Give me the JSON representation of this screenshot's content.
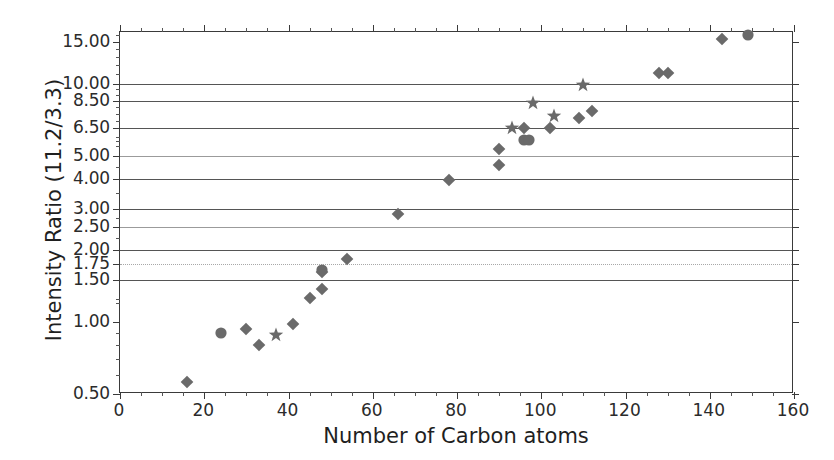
{
  "chart_data": {
    "type": "scatter",
    "title": "",
    "xlabel": "Number of Carbon atoms",
    "ylabel": "Intensity Ratio (11.2/3.3)",
    "xlim": [
      0,
      160
    ],
    "ylim": [
      0.5,
      16.5
    ],
    "yscale": "log",
    "grid": true,
    "legend": null,
    "marker_color": "#6a6a6a",
    "axis_color": "#3a3a3a",
    "gridline_color": "#555555",
    "xticks": [
      0,
      20,
      40,
      60,
      80,
      100,
      120,
      140,
      160
    ],
    "xtick_labels": [
      "0",
      "20",
      "40",
      "60",
      "80",
      "100",
      "120",
      "140",
      "160"
    ],
    "xtick_minor_step": 5,
    "yticks": [
      0.5,
      1.0,
      1.5,
      1.75,
      2.0,
      2.5,
      3.0,
      4.0,
      5.0,
      6.5,
      8.5,
      10.0,
      15.0
    ],
    "ytick_labels": [
      "0.50",
      "1.00",
      "1.50",
      "1.75",
      "2.00",
      "2.50",
      "3.00",
      "4.00",
      "5.00",
      "6.50",
      "8.50",
      "10.00",
      "15.00"
    ],
    "gridline_values": [
      1.5,
      1.75,
      2.0,
      2.5,
      3.0,
      4.0,
      5.0,
      6.5,
      8.5,
      10.0
    ],
    "ytick_minor_values": [
      0.6,
      0.7,
      0.8,
      0.9,
      1.2,
      1.25,
      2.25,
      2.75,
      3.5,
      4.5,
      5.5,
      5.75,
      6.0,
      7.0,
      7.5,
      8.0,
      9.0,
      9.5,
      11.0,
      12.0,
      13.0,
      14.0,
      16.0
    ],
    "series": [
      {
        "name": "diamond-series",
        "marker": "diamond",
        "points": [
          {
            "x": 16,
            "y": 0.56
          },
          {
            "x": 30,
            "y": 0.94
          },
          {
            "x": 33,
            "y": 0.8
          },
          {
            "x": 41,
            "y": 0.98
          },
          {
            "x": 45,
            "y": 1.26
          },
          {
            "x": 48,
            "y": 1.38
          },
          {
            "x": 48,
            "y": 1.63
          },
          {
            "x": 54,
            "y": 1.85
          },
          {
            "x": 66,
            "y": 2.85
          },
          {
            "x": 78,
            "y": 3.95
          },
          {
            "x": 90,
            "y": 5.35
          },
          {
            "x": 90,
            "y": 4.55
          },
          {
            "x": 96,
            "y": 6.55
          },
          {
            "x": 102,
            "y": 6.55
          },
          {
            "x": 109,
            "y": 7.2
          },
          {
            "x": 112,
            "y": 7.7
          },
          {
            "x": 128,
            "y": 11.1
          },
          {
            "x": 130,
            "y": 11.1
          },
          {
            "x": 143,
            "y": 15.4
          }
        ]
      },
      {
        "name": "circle-series",
        "marker": "circle",
        "points": [
          {
            "x": 24,
            "y": 0.9
          },
          {
            "x": 48,
            "y": 1.66
          },
          {
            "x": 96,
            "y": 5.8
          },
          {
            "x": 97,
            "y": 5.8
          },
          {
            "x": 149,
            "y": 16.0
          }
        ]
      },
      {
        "name": "star-series",
        "marker": "star",
        "points": [
          {
            "x": 37,
            "y": 0.88
          },
          {
            "x": 93,
            "y": 6.55
          },
          {
            "x": 98,
            "y": 8.3
          },
          {
            "x": 103,
            "y": 7.3
          },
          {
            "x": 110,
            "y": 9.9
          }
        ]
      }
    ]
  }
}
